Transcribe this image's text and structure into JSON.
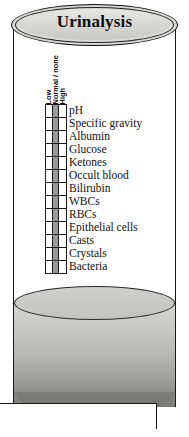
{
  "figure": {
    "title": "Urinalysis",
    "kind": "urinalysis-results-chart"
  },
  "columns": [
    {
      "key": "low",
      "label": "Low"
    },
    {
      "key": "normal",
      "label": "Normal / none"
    },
    {
      "key": "high",
      "label": "High"
    }
  ],
  "rows": [
    {
      "label": "pH",
      "low": "",
      "normal": "shaded",
      "high": ""
    },
    {
      "label": "Specific gravity",
      "low": "",
      "normal": "shaded",
      "high": ""
    },
    {
      "label": "Albumin",
      "low": "",
      "normal": "shaded",
      "high": ""
    },
    {
      "label": "Glucose",
      "low": "",
      "normal": "shaded",
      "high": ""
    },
    {
      "label": "Ketones",
      "low": "",
      "normal": "shaded",
      "high": ""
    },
    {
      "label": "Occult blood",
      "low": "",
      "normal": "shaded",
      "high": ""
    },
    {
      "label": "Bilirubin",
      "low": "",
      "normal": "shaded",
      "high": ""
    },
    {
      "label": "WBCs",
      "low": "",
      "normal": "shaded",
      "high": ""
    },
    {
      "label": "RBCs",
      "low": "",
      "normal": "shaded",
      "high": ""
    },
    {
      "label": "Epithelial cells",
      "low": "",
      "normal": "shaded",
      "high": ""
    },
    {
      "label": "Casts",
      "low": "",
      "normal": "shaded",
      "high": ""
    },
    {
      "label": "Crystals",
      "low": "",
      "normal": "shaded",
      "high": ""
    },
    {
      "label": "Bacteria",
      "low": "",
      "normal": "shaded",
      "high": ""
    }
  ],
  "colors": {
    "outline": "#1b1b1b",
    "normal_cell_fill": "#9a9a9a",
    "empty_cell_fill": "#ffffff",
    "title_plate_fill": "#dcdcd9",
    "liquid_top": "#d4d4d1",
    "liquid_bottom": "#6e6e6b"
  }
}
